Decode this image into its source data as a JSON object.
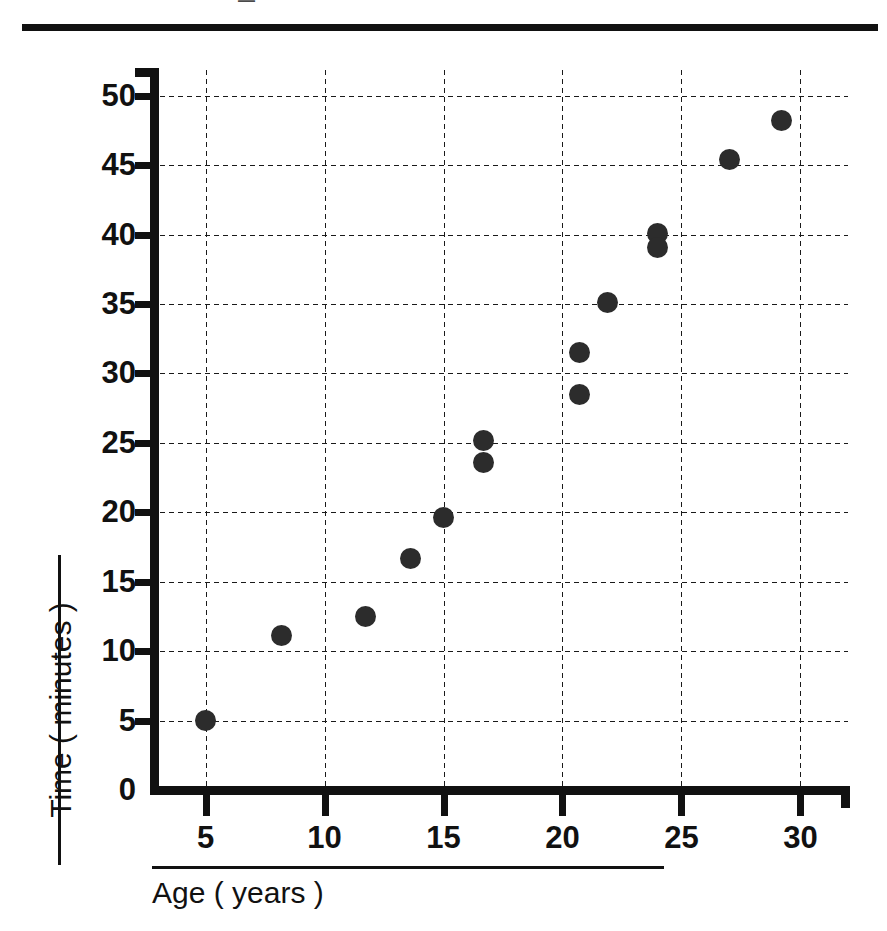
{
  "figure": {
    "clipped_header_text": "—",
    "background_color": "#ffffff",
    "ink_color": "#111111",
    "marker_color": "#2c2c2c"
  },
  "chart_data": {
    "type": "scatter",
    "title": "",
    "xlabel": "Age ( years )",
    "ylabel": "Time ( minutes )",
    "xlim": [
      3,
      32
    ],
    "ylim": [
      0,
      52
    ],
    "xticks": [
      5,
      10,
      15,
      20,
      25,
      30
    ],
    "yticks": [
      0,
      5,
      10,
      15,
      20,
      25,
      30,
      35,
      40,
      45,
      50
    ],
    "xtick_labels": [
      "5",
      "10",
      "15",
      "20",
      "25",
      "30"
    ],
    "ytick_labels": [
      "0",
      "5",
      "10",
      "15",
      "20",
      "25",
      "30",
      "35",
      "40",
      "45",
      "50"
    ],
    "grid": true,
    "grid_style": "dotted",
    "legend": false,
    "marker": "filled-circle",
    "points": [
      {
        "x": 5.0,
        "y": 5.0
      },
      {
        "x": 8.2,
        "y": 11.1
      },
      {
        "x": 11.7,
        "y": 12.5
      },
      {
        "x": 13.6,
        "y": 16.7
      },
      {
        "x": 15.0,
        "y": 19.6
      },
      {
        "x": 16.7,
        "y": 25.2
      },
      {
        "x": 16.7,
        "y": 23.6
      },
      {
        "x": 20.7,
        "y": 31.5
      },
      {
        "x": 20.7,
        "y": 28.5
      },
      {
        "x": 21.9,
        "y": 35.1
      },
      {
        "x": 24.0,
        "y": 40.1
      },
      {
        "x": 24.0,
        "y": 39.1
      },
      {
        "x": 27.0,
        "y": 45.4
      },
      {
        "x": 29.2,
        "y": 48.2
      }
    ]
  }
}
